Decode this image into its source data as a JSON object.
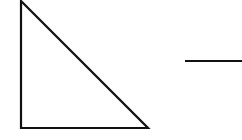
{
  "diagram": {
    "background": "#ffffff",
    "stroke_color": "#111111",
    "shapes": [
      {
        "type": "right-triangle",
        "points": [
          [
            21,
            0
          ],
          [
            21,
            128
          ],
          [
            148,
            128
          ]
        ]
      },
      {
        "type": "line",
        "from": [
          185,
          61
        ],
        "to": [
          242,
          61
        ]
      }
    ]
  }
}
